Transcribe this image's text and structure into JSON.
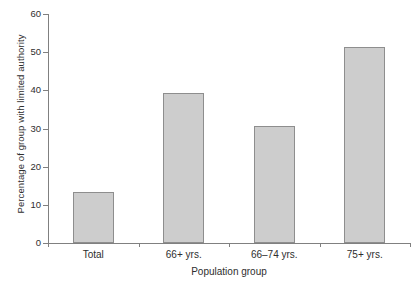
{
  "chart_data": {
    "type": "bar",
    "title": "",
    "xlabel": "Population group",
    "ylabel": "Percentage of group with limited authority",
    "categories": [
      "Total",
      "66+ yrs.",
      "66–74 yrs.",
      "75+ yrs."
    ],
    "values": [
      13.3,
      39.2,
      30.7,
      51.3
    ],
    "ylim": [
      0,
      60
    ],
    "yticks": [
      0,
      10,
      20,
      30,
      40,
      50,
      60
    ],
    "ytick_labels": [
      "0",
      "10",
      "20",
      "30",
      "40",
      "50",
      "60"
    ],
    "grid": false,
    "legend": null,
    "bar_color": "#cdcdcd",
    "bar_edge_color": "#8e8e8e",
    "axis_color": "#808080"
  },
  "axis": {
    "y_title": "Percentage of group with limited authority",
    "x_title": "Population group"
  },
  "ticks": {
    "y": [
      {
        "label": "60",
        "value": 60
      },
      {
        "label": "50",
        "value": 50
      },
      {
        "label": "40",
        "value": 40
      },
      {
        "label": "30",
        "value": 30
      },
      {
        "label": "20",
        "value": 20
      },
      {
        "label": "10",
        "value": 10
      },
      {
        "label": "0",
        "value": 0
      }
    ]
  },
  "bars": [
    {
      "label": "Total",
      "value": 13.3
    },
    {
      "label": "66+ yrs.",
      "value": 39.2
    },
    {
      "label": "66–74 yrs.",
      "value": 30.7
    },
    {
      "label": "75+ yrs.",
      "value": 51.3
    }
  ]
}
